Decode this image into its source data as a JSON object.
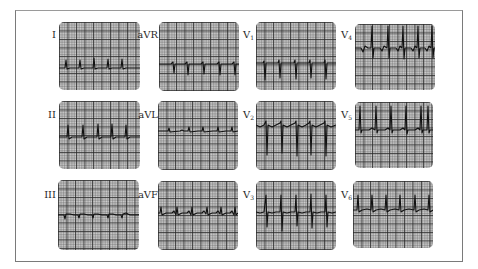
{
  "figure": {
    "type": "12-lead ECG",
    "layout": "3 rows x 4 columns",
    "colors": {
      "paper": "#cfcfcf",
      "grid": "#282828",
      "trace": "#111111",
      "frame": "#7a7a7a"
    }
  },
  "leads": [
    {
      "id": "I",
      "label": "I",
      "sub": ""
    },
    {
      "id": "aVR",
      "label": "aVR",
      "sub": ""
    },
    {
      "id": "V1",
      "label": "V",
      "sub": "1"
    },
    {
      "id": "V4",
      "label": "V",
      "sub": "4"
    },
    {
      "id": "II",
      "label": "II",
      "sub": ""
    },
    {
      "id": "aVL",
      "label": "aVL",
      "sub": ""
    },
    {
      "id": "V2",
      "label": "V",
      "sub": "2"
    },
    {
      "id": "V5",
      "label": "V",
      "sub": "5"
    },
    {
      "id": "III",
      "label": "III",
      "sub": ""
    },
    {
      "id": "aVF",
      "label": "aVF",
      "sub": ""
    },
    {
      "id": "V3",
      "label": "V",
      "sub": "3"
    },
    {
      "id": "V6",
      "label": "V",
      "sub": "6"
    }
  ]
}
